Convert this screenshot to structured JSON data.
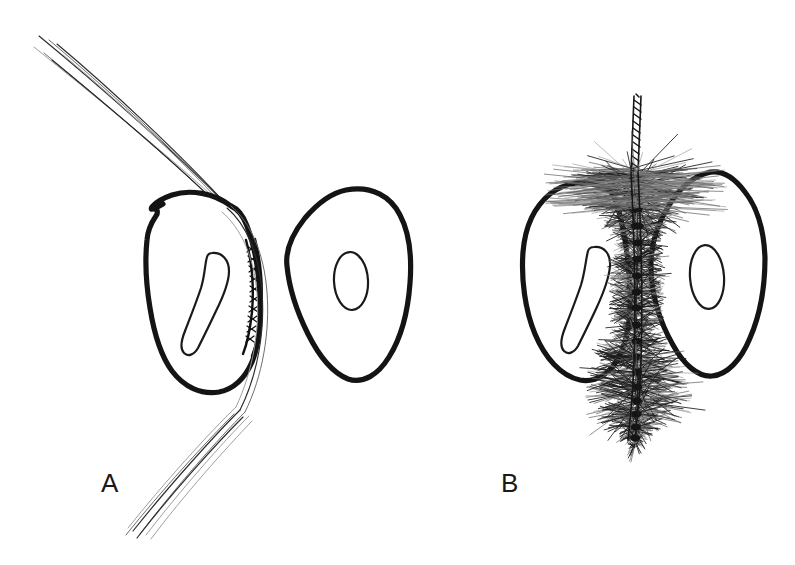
{
  "figure": {
    "background_color": "#ffffff",
    "ink_color": "#141414",
    "width": 795,
    "height": 565,
    "panels": [
      {
        "id": "A",
        "label": "A",
        "label_x": 101,
        "label_y": 470,
        "caption": "Dental floss passing through the interproximal space between two teeth",
        "instrument": "dental-floss",
        "instrument_description": "Multi-filament floss strand bent sharply around the distal contour of the left tooth, shown braided in cross-section within the contact area",
        "teeth": [
          {
            "name": "left-tooth",
            "shape": "oval molar cross-section",
            "pulp": "crescent-shaped pulp canal",
            "center_x": 205,
            "center_y": 290
          },
          {
            "name": "right-tooth",
            "shape": "rounded triangular premolar cross-section",
            "pulp": "narrow oval pulp canal",
            "center_x": 348,
            "center_y": 288
          }
        ]
      },
      {
        "id": "B",
        "label": "B",
        "label_x": 501,
        "label_y": 470,
        "caption": "Interdental brush filling the interproximal space between two teeth",
        "instrument": "interdental-brush",
        "instrument_description": "Twisted wire core with radiating nylon bristles spanning and overfilling the embrasure, contacting both adjacent tooth surfaces",
        "teeth": [
          {
            "name": "left-tooth",
            "shape": "oval molar cross-section",
            "pulp": "crescent-shaped pulp canal",
            "center_x": 590,
            "center_y": 288
          },
          {
            "name": "right-tooth",
            "shape": "rounded triangular premolar cross-section",
            "pulp": "narrow oval pulp canal",
            "center_x": 712,
            "center_y": 283
          }
        ]
      }
    ]
  },
  "chart_data": {
    "type": "diagram",
    "categories": [
      "A",
      "B"
    ],
    "series": [
      {
        "name": "Panel A — Dental floss",
        "instrument": "dental floss",
        "teeth_count": 2,
        "contact_coverage_note": "Floss contacts only a narrow band of the interproximal surface"
      },
      {
        "name": "Panel B — Interdental brush",
        "instrument": "interdental brush",
        "teeth_count": 2,
        "contact_coverage_note": "Brush bristles fill the embrasure and contact the full concave surface"
      }
    ],
    "xlabel": "",
    "ylabel": "",
    "legend": [
      "A",
      "B"
    ],
    "grid": false
  }
}
